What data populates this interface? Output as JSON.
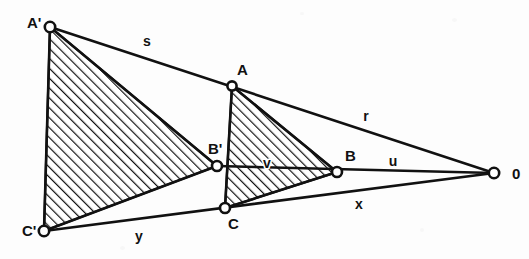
{
  "figure": {
    "background_color": "#fdfdfd",
    "ink_color": "#111111"
  },
  "vertices": [
    {
      "id": "A_prime",
      "label": "A'",
      "x": 50,
      "y": 27,
      "label_x": 27,
      "label_y": 24
    },
    {
      "id": "C_prime",
      "label": "C'",
      "x": 44,
      "y": 231,
      "label_x": 22,
      "label_y": 232
    },
    {
      "id": "B_prime",
      "label": "B'",
      "x": 217,
      "y": 166,
      "label_x": 208,
      "label_y": 150
    },
    {
      "id": "A",
      "label": "A",
      "x": 232,
      "y": 86,
      "label_x": 237,
      "label_y": 71
    },
    {
      "id": "C",
      "label": "C",
      "x": 225,
      "y": 208,
      "label_x": 228,
      "label_y": 225
    },
    {
      "id": "B",
      "label": "B",
      "x": 337,
      "y": 172,
      "label_x": 345,
      "label_y": 157
    },
    {
      "id": "O",
      "label": "0",
      "x": 494,
      "y": 173,
      "label_x": 512,
      "label_y": 175
    }
  ],
  "segment_labels": [
    {
      "id": "s",
      "label": "s",
      "x": 147,
      "y": 42,
      "inside_hatch": false
    },
    {
      "id": "r",
      "label": "r",
      "x": 366,
      "y": 117,
      "inside_hatch": false
    },
    {
      "id": "u",
      "label": "u",
      "x": 393,
      "y": 162,
      "inside_hatch": false
    },
    {
      "id": "v",
      "label": "v",
      "x": 267,
      "y": 164,
      "inside_hatch": true
    },
    {
      "id": "x",
      "label": "x",
      "x": 359,
      "y": 205,
      "inside_hatch": false
    },
    {
      "id": "y",
      "label": "y",
      "x": 139,
      "y": 237,
      "inside_hatch": false
    }
  ],
  "edges": [
    {
      "id": "edge-Aprime-Cprime",
      "from": "A_prime",
      "to": "C_prime"
    },
    {
      "id": "edge-Aprime-O",
      "from": "A_prime",
      "to": "O"
    },
    {
      "id": "edge-Bprime-O",
      "from": "B_prime",
      "to": "O"
    },
    {
      "id": "edge-Cprime-O",
      "from": "C_prime",
      "to": "O"
    },
    {
      "id": "edge-Aprime-Bprime",
      "from": "A_prime",
      "to": "B_prime"
    },
    {
      "id": "edge-Bprime-Cprime",
      "from": "B_prime",
      "to": "C_prime"
    },
    {
      "id": "edge-A-C",
      "from": "A",
      "to": "C"
    },
    {
      "id": "edge-A-B",
      "from": "A",
      "to": "B"
    },
    {
      "id": "edge-B-C",
      "from": "B",
      "to": "C"
    }
  ],
  "hatched_regions": [
    {
      "id": "region-large",
      "name": "triangle-A-prime-B-prime-C-prime",
      "points": "50,27 217,166 44,231"
    },
    {
      "id": "region-small",
      "name": "triangle-A-B-C",
      "points": "232,86 337,172 225,208"
    }
  ],
  "hatch": {
    "angle_label": "45",
    "spacing_px": 7,
    "stroke_width_px": 2.4
  }
}
